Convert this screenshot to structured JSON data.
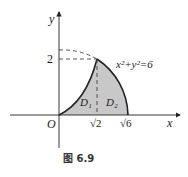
{
  "figure": {
    "caption": "图 6.9",
    "axes": {
      "x_label": "x",
      "y_label": "y",
      "origin_label": "O"
    },
    "ticks": {
      "y_tick": "2",
      "x_ticks": [
        "√2",
        "√6"
      ]
    },
    "equation": "x²+y²=6",
    "regions": [
      "D₁",
      "D₂"
    ],
    "colors": {
      "fill": "#c8c8c8",
      "stroke": "#222222"
    }
  }
}
